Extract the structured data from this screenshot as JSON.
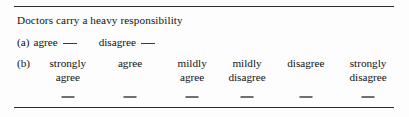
{
  "figure": {
    "name": "likert-survey-item",
    "question_stem": "Doctors carry a heavy responsibility",
    "rules": {
      "top": "horizontal-rule",
      "bottom": "horizontal-rule"
    }
  },
  "part_a": {
    "marker": "(a)",
    "options": [
      {
        "label": "agree",
        "blank": "answer-blank"
      },
      {
        "label": "disagree",
        "blank": "answer-blank"
      }
    ]
  },
  "part_b": {
    "marker": "(b)",
    "options": [
      {
        "line1": "strongly",
        "line2": "agree",
        "center_pct": 10.0
      },
      {
        "line1": "agree",
        "line2": "",
        "center_pct": 26.9
      },
      {
        "line1": "mildly",
        "line2": "agree",
        "center_pct": 43.8
      },
      {
        "line1": "mildly",
        "line2": "disagree",
        "center_pct": 58.7
      },
      {
        "line1": "disagree",
        "line2": "",
        "center_pct": 74.7
      },
      {
        "line1": "strongly",
        "line2": "disagree",
        "center_pct": 91.6
      }
    ],
    "blanks": [
      {
        "name": "answer-blank-strongly-agree",
        "center_pct": 10.0
      },
      {
        "name": "answer-blank-agree",
        "center_pct": 26.9
      },
      {
        "name": "answer-blank-mildly-agree",
        "center_pct": 43.8
      },
      {
        "name": "answer-blank-mildly-disagree",
        "center_pct": 58.7
      },
      {
        "name": "answer-blank-disagree",
        "center_pct": 74.7
      },
      {
        "name": "answer-blank-strongly-disagree",
        "center_pct": 91.6
      }
    ]
  },
  "colors": {
    "ink": "#111111",
    "rule": "#2b2b2b",
    "blank": "#6f6f6f",
    "page": "#fdfdfd"
  }
}
